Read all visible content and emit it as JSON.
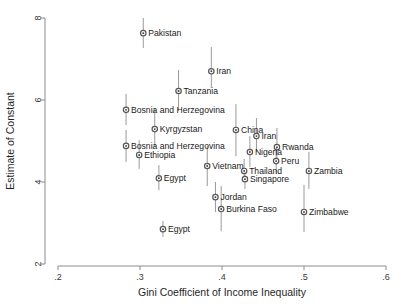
{
  "chart_data": {
    "type": "scatter",
    "title": "",
    "xlabel": "Gini Coefficient of Income Inequality",
    "ylabel": "Estimate of Constant",
    "xlim": [
      0.2,
      0.6
    ],
    "ylim": [
      2,
      8
    ],
    "xticks": [
      ".2",
      ".3",
      ".4",
      ".5",
      ".6"
    ],
    "xtick_values": [
      0.2,
      0.3,
      0.4,
      0.5,
      0.6
    ],
    "yticks": [
      "2",
      "4",
      "6",
      "8"
    ],
    "ytick_values": [
      2,
      4,
      6,
      8
    ],
    "grid": false,
    "legend": "none",
    "marker_style": "circle-with-dot",
    "error_bars": "vertical confidence intervals",
    "points": [
      {
        "label": "Pakistan",
        "x": 0.304,
        "y": 7.63,
        "lo": 7.27,
        "hi": 8.0,
        "label_side": "right"
      },
      {
        "label": "Iran",
        "x": 0.387,
        "y": 6.7,
        "lo": 6.29,
        "hi": 7.29,
        "label_side": "right"
      },
      {
        "label": "Tanzania",
        "x": 0.347,
        "y": 6.22,
        "lo": 5.73,
        "hi": 6.73,
        "label_side": "right"
      },
      {
        "label": "Bosnia and Herzegovina",
        "x": 0.283,
        "y": 5.76,
        "lo": 5.39,
        "hi": 6.15,
        "label_side": "right"
      },
      {
        "label": "Kyrgyzstan",
        "x": 0.318,
        "y": 5.29,
        "lo": 4.85,
        "hi": 5.78,
        "label_side": "right"
      },
      {
        "label": "China",
        "x": 0.417,
        "y": 5.27,
        "lo": 4.63,
        "hi": 5.9,
        "label_side": "right"
      },
      {
        "label": "Iran",
        "x": 0.442,
        "y": 5.12,
        "lo": 4.73,
        "hi": 5.56,
        "label_side": "right"
      },
      {
        "label": "Bosnia and Herzegovina",
        "x": 0.283,
        "y": 4.88,
        "lo": 4.49,
        "hi": 5.27,
        "label_side": "right"
      },
      {
        "label": "Rwanda",
        "x": 0.467,
        "y": 4.85,
        "lo": 4.46,
        "hi": 5.32,
        "label_side": "right"
      },
      {
        "label": "Ethiopia",
        "x": 0.299,
        "y": 4.66,
        "lo": 4.32,
        "hi": 5.02,
        "label_side": "right"
      },
      {
        "label": "Nigeria",
        "x": 0.434,
        "y": 4.73,
        "lo": 4.37,
        "hi": 5.12,
        "label_side": "right"
      },
      {
        "label": "Peru",
        "x": 0.466,
        "y": 4.51,
        "lo": 4.2,
        "hi": 4.88,
        "label_side": "right"
      },
      {
        "label": "Vietnam",
        "x": 0.382,
        "y": 4.39,
        "lo": 3.9,
        "hi": 4.88,
        "label_side": "right"
      },
      {
        "label": "Thailand",
        "x": 0.427,
        "y": 4.27,
        "lo": 4.0,
        "hi": 4.56,
        "label_side": "right"
      },
      {
        "label": "Zambia",
        "x": 0.506,
        "y": 4.27,
        "lo": 3.83,
        "hi": 4.73,
        "label_side": "right"
      },
      {
        "label": "Singapore",
        "x": 0.428,
        "y": 4.07,
        "lo": 3.83,
        "hi": 4.34,
        "label_side": "right"
      },
      {
        "label": "Egypt",
        "x": 0.323,
        "y": 4.09,
        "lo": 3.8,
        "hi": 4.41,
        "label_side": "right"
      },
      {
        "label": "Jordan",
        "x": 0.392,
        "y": 3.63,
        "lo": 3.27,
        "hi": 4.0,
        "label_side": "right"
      },
      {
        "label": "Burkina Faso",
        "x": 0.399,
        "y": 3.34,
        "lo": 2.8,
        "hi": 3.9,
        "label_side": "right"
      },
      {
        "label": "Zimbabwe",
        "x": 0.5,
        "y": 3.27,
        "lo": 2.78,
        "hi": 3.93,
        "label_side": "right"
      },
      {
        "label": "Egypt",
        "x": 0.328,
        "y": 2.85,
        "lo": 2.66,
        "hi": 3.05,
        "label_side": "right"
      }
    ],
    "colors": {
      "axis": "#8c8c8c",
      "marker_edge": "#555555",
      "marker_fill": "#ffffff",
      "marker_center": "#3d3d3d",
      "error_bar": "#9a9a9a",
      "text": "#1a1a1a",
      "background": "#ffffff"
    }
  }
}
